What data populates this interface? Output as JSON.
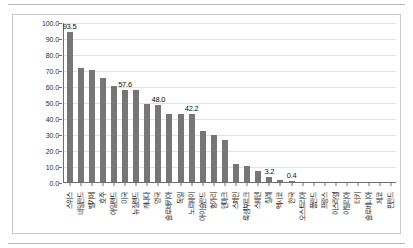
{
  "chart_data": {
    "type": "bar",
    "title": "",
    "subtitle": "",
    "xlabel": "",
    "ylabel": "",
    "ylim": [
      0,
      100
    ],
    "ytick_labels": [
      "100.0",
      "90.0",
      "80.0",
      "70.0",
      "60.0",
      "50.0",
      "40.0",
      "30.0",
      "20.0",
      "10.0",
      "0.0"
    ],
    "ytick_values": [
      100,
      90,
      80,
      70,
      60,
      50,
      40,
      30,
      20,
      10,
      0
    ],
    "grid": true,
    "legend": "none",
    "bar_color": "#767676",
    "categories": [
      "스위스",
      "네덜란드",
      "벨기에",
      "호주",
      "아일랜드",
      "미국",
      "뉴질랜드",
      "캐나다",
      "영국",
      "슬로바키아",
      "독일",
      "노르웨이",
      "아이슬란드",
      "헝가리",
      "덴마크",
      "스페인",
      "룩셈부르크",
      "스웨덴",
      "칠레",
      "멕시코",
      "한국",
      "오스트리아",
      "폴란드",
      "프랑스",
      "이스라엘",
      "이탈리아",
      "터키",
      "슬로베니아",
      "체코",
      "핀란드"
    ],
    "values": [
      93.5,
      71.4,
      69.8,
      64.9,
      60.3,
      57.6,
      57.5,
      49.0,
      48.0,
      42.5,
      42.4,
      42.2,
      31.6,
      29.1,
      26.0,
      11.5,
      10.3,
      7.0,
      3.2,
      1.2,
      0.4,
      0.0,
      0.0,
      0.0,
      0.0,
      0.0,
      0.0,
      0.0,
      0.0,
      0.0
    ],
    "value_labels": {
      "0": "93.5",
      "5": "57.6",
      "8": "48.0",
      "11": "42.2",
      "18": "3.2",
      "20": "0.4"
    }
  }
}
